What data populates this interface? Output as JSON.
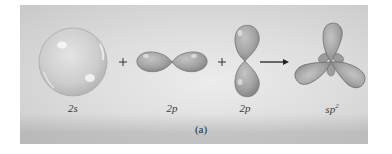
{
  "figure": {
    "caption": "(a)",
    "orbitals": [
      {
        "id": "2s",
        "label": "2s",
        "shape": "sphere"
      },
      {
        "id": "2p-horizontal",
        "label": "2p",
        "shape": "dumbbell-horizontal"
      },
      {
        "id": "2p-vertical",
        "label": "2p",
        "shape": "dumbbell-vertical"
      },
      {
        "id": "sp2",
        "label_base": "sp",
        "label_sup": "2",
        "shape": "trigonal-planar-hybrid"
      }
    ],
    "operators": [
      "+",
      "+"
    ],
    "arrow": "→",
    "colors": {
      "panel_light": "#ececec",
      "panel_dark": "#c4c4c4",
      "orbital_fill": "#a6a6a6",
      "orbital_edge": "#6f6f6f",
      "sphere_fill": "#cfcfcf",
      "text": "#3a3a3a"
    }
  }
}
